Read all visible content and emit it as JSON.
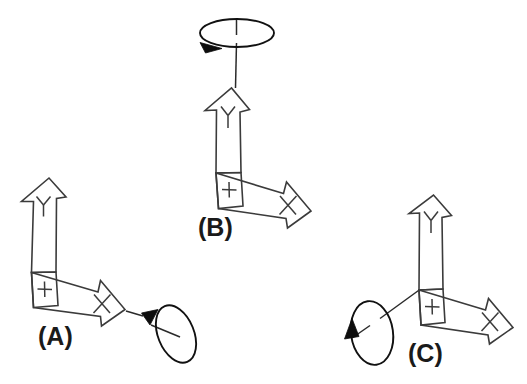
{
  "figure": {
    "background_color": "#ffffff",
    "line_color": "#3b3b3b",
    "arrow_fill": "#ffffff",
    "rotation_arrow_color": "#0d0d0d",
    "label_color": "#1a1a1a",
    "width": 527,
    "height": 384
  },
  "panels": [
    {
      "id": "A",
      "label": "(A)",
      "label_x": 38,
      "label_y": 345,
      "axes": [
        {
          "name": "y-axis",
          "letter": "Y",
          "direction": "up"
        },
        {
          "name": "x-axis",
          "letter": "X",
          "direction": "right-down"
        },
        {
          "name": "z-axis",
          "letter": "+",
          "direction": "out-of-page"
        }
      ],
      "rotation": {
        "about": "x-axis",
        "sense": "counterclockwise-viewed-from-plus-x",
        "ellipse_center_x": 176,
        "ellipse_center_y": 334,
        "ellipse_rx": 18,
        "ellipse_ry": 30,
        "ellipse_rotate_deg": -22
      }
    },
    {
      "id": "B",
      "label": "(B)",
      "label_x": 198,
      "label_y": 236,
      "axes": [
        {
          "name": "y-axis",
          "letter": "Y",
          "direction": "up"
        },
        {
          "name": "x-axis",
          "letter": "X",
          "direction": "right-down"
        },
        {
          "name": "z-axis",
          "letter": "+",
          "direction": "out-of-page"
        }
      ],
      "rotation": {
        "about": "y-axis",
        "sense": "clockwise-viewed-from-plus-y",
        "ellipse_center_x": 237,
        "ellipse_center_y": 35,
        "ellipse_rx": 37,
        "ellipse_ry": 14,
        "ellipse_rotate_deg": 0
      }
    },
    {
      "id": "C",
      "label": "(C)",
      "label_x": 408,
      "label_y": 362,
      "axes": [
        {
          "name": "y-axis",
          "letter": "Y",
          "direction": "up"
        },
        {
          "name": "x-axis",
          "letter": "X",
          "direction": "right-down"
        },
        {
          "name": "z-axis",
          "letter": "+",
          "direction": "out-of-page"
        }
      ],
      "rotation": {
        "about": "z-axis",
        "sense": "counterclockwise-viewed-from-plus-z",
        "ellipse_center_x": 372,
        "ellipse_center_y": 333,
        "ellipse_rx": 21,
        "ellipse_ry": 32,
        "ellipse_rotate_deg": -8
      }
    }
  ],
  "glyphs": {
    "y_letter": "Y",
    "x_letter": "X",
    "z_plus": "+"
  }
}
